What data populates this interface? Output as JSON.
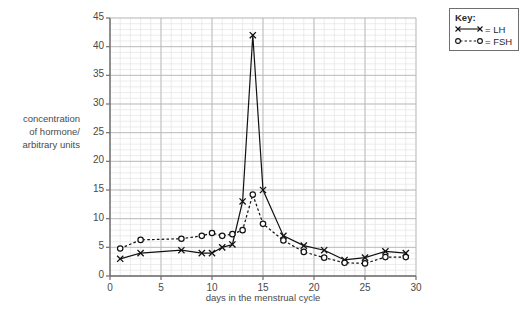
{
  "chart_data": {
    "type": "line",
    "title": "",
    "xlabel": "days in the menstrual cycle",
    "ylabel": "concentration of hormone/ arbitrary units",
    "ylabel_lines": [
      "concentration",
      "of hormone/",
      "arbitrary units"
    ],
    "xlim": [
      0,
      30
    ],
    "ylim": [
      0,
      45
    ],
    "xticks": [
      0,
      5,
      10,
      15,
      20,
      25,
      30
    ],
    "yticks": [
      0,
      5,
      10,
      15,
      20,
      25,
      30,
      35,
      40,
      45
    ],
    "grid": true,
    "grid_minor_step_x": 1,
    "grid_minor_step_y": 1,
    "legend_position": "outside-top-right",
    "x": [
      1,
      3,
      7,
      9,
      10,
      11,
      12,
      13,
      14,
      15,
      17,
      19,
      21,
      23,
      25,
      27,
      29
    ],
    "series": [
      {
        "name": "LH",
        "marker": "x",
        "line_style": "solid",
        "color": "#111111",
        "values": [
          3,
          4,
          4.5,
          4,
          4,
          5,
          5.5,
          13,
          42,
          15,
          7,
          5.3,
          4.5,
          2.8,
          3.2,
          4.3,
          4
        ]
      },
      {
        "name": "FSH",
        "marker": "o",
        "line_style": "dashed",
        "color": "#111111",
        "values": [
          4.8,
          6.3,
          6.5,
          7,
          7.5,
          7,
          7.3,
          8,
          14.2,
          9.1,
          6.2,
          4.2,
          3.2,
          2.3,
          2.2,
          3.3,
          3.3
        ]
      }
    ]
  },
  "legend": {
    "title": "Key:",
    "entries": [
      {
        "label": "= LH",
        "marker": "x",
        "line_style": "solid"
      },
      {
        "label": "= FSH",
        "marker": "o",
        "line_style": "dashed"
      }
    ]
  },
  "colors": {
    "background": "#ffffff",
    "axis": "#6f6f6f",
    "grid_major": "#b8b8b8",
    "grid_minor": "#e4e4e4",
    "text": "#4a4a4a",
    "ink": "#111111"
  }
}
